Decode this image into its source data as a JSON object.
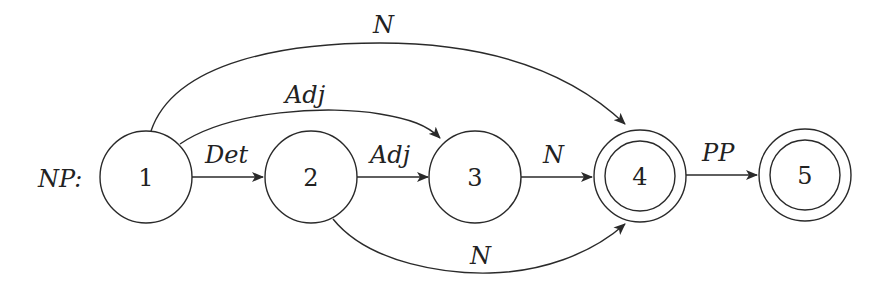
{
  "diagram": {
    "type": "finite-state-automaton",
    "title_label": "NP:",
    "nodes": [
      {
        "id": "1",
        "label": "1",
        "accepting": false
      },
      {
        "id": "2",
        "label": "2",
        "accepting": false
      },
      {
        "id": "3",
        "label": "3",
        "accepting": false
      },
      {
        "id": "4",
        "label": "4",
        "accepting": true
      },
      {
        "id": "5",
        "label": "5",
        "accepting": true
      }
    ],
    "edges": [
      {
        "from": "1",
        "to": "2",
        "label": "Det"
      },
      {
        "from": "2",
        "to": "3",
        "label": "Adj"
      },
      {
        "from": "3",
        "to": "4",
        "label": "N"
      },
      {
        "from": "4",
        "to": "5",
        "label": "PP"
      },
      {
        "from": "1",
        "to": "3",
        "label": "Adj"
      },
      {
        "from": "1",
        "to": "4",
        "label": "N"
      },
      {
        "from": "2",
        "to": "4",
        "label": "N"
      }
    ],
    "colors": {
      "stroke": "#2a2a2a",
      "background": "#ffffff"
    }
  }
}
